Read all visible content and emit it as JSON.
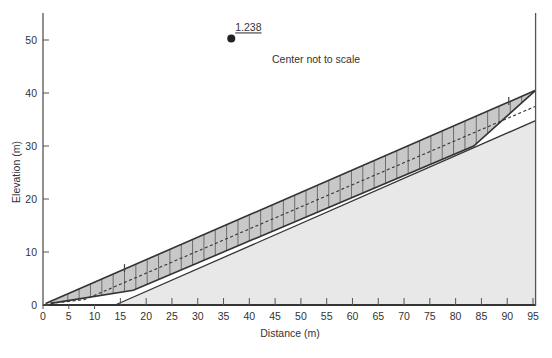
{
  "figure": {
    "type": "slope-stability-cross-section",
    "annotation": "Center not to scale",
    "factor_of_safety_label": "1.238"
  },
  "chart_data": {
    "type": "diagram",
    "xlabel": "Distance (m)",
    "ylabel": "Elevation (m)",
    "xlim": [
      0,
      96
    ],
    "ylim": [
      0,
      55
    ],
    "xticks": [
      0,
      5,
      10,
      15,
      20,
      25,
      30,
      35,
      40,
      45,
      50,
      55,
      60,
      65,
      70,
      75,
      80,
      85,
      90,
      95
    ],
    "yticks": [
      0,
      10,
      20,
      30,
      40,
      50
    ],
    "slip_center": {
      "x": 36.5,
      "y": 50.3,
      "label": "1.238"
    },
    "slope_surface": [
      [
        0.5,
        0.3
      ],
      [
        95.5,
        40.5
      ]
    ],
    "ground_surface": [
      [
        14,
        0
      ],
      [
        95.5,
        34.8
      ]
    ],
    "base_line": [
      [
        0,
        0
      ],
      [
        95.5,
        0
      ]
    ],
    "slip_surface": [
      [
        1.5,
        0.3
      ],
      [
        17.5,
        2.8
      ],
      [
        83.5,
        30.0
      ],
      [
        95.5,
        40.5
      ]
    ],
    "water_table": [
      [
        1.5,
        0.3
      ],
      [
        8,
        1.0
      ],
      [
        95.5,
        37.5
      ]
    ],
    "slice_width": 2.2,
    "surface_marks": [
      15.8,
      90.3
    ],
    "colors": {
      "sliding_mass_fill": "#c8c8c8",
      "ground_fill": "#e8e8e8",
      "line": "#333333",
      "axis": "#555555"
    }
  }
}
